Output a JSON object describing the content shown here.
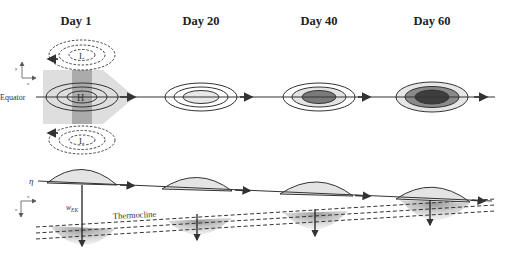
{
  "titles": [
    "Day 1",
    "Day 20",
    "Day 40",
    "Day 60"
  ],
  "labels": {
    "equator": "Equator",
    "high": "H",
    "low": "L",
    "eta": "η",
    "w_ek": "w",
    "w_ek_sub": "EK",
    "thermocline": "Thermocline",
    "axis_y": "y",
    "axis_x": "x",
    "axis_z": "z"
  },
  "colors": {
    "line": "#333333",
    "light_gray": "#e6e6e6",
    "mid_gray": "#b8b8b8",
    "dark_gray": "#7a7a7a",
    "darkest_gray": "#3e3e3e",
    "wind_region": "#dcdcdc",
    "wind_band": "#a8a8a8"
  }
}
